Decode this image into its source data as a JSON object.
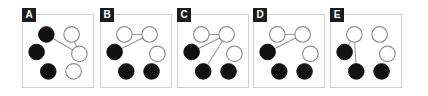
{
  "figure": {
    "panel_count": 5,
    "node_count_per_panel": 6,
    "colors": {
      "filled_node": "#111111",
      "open_node_fill": "#ffffff",
      "open_node_stroke": "#8f8f8f",
      "edge": "#9a9a9a",
      "panel_border": "#cfcfcf",
      "badge_background": "#1c1c1c",
      "badge_text": "#ffffff",
      "background": "#ffffff"
    },
    "node_layout": [
      {
        "id": "tl",
        "cx": 24,
        "cy": 20
      },
      {
        "id": "tr",
        "cx": 50,
        "cy": 20
      },
      {
        "id": "ml",
        "cx": 14,
        "cy": 38
      },
      {
        "id": "mr",
        "cx": 58,
        "cy": 40
      },
      {
        "id": "bl",
        "cx": 26,
        "cy": 58
      },
      {
        "id": "br",
        "cx": 52,
        "cy": 58
      }
    ],
    "node_radius": 8,
    "panels": [
      {
        "label": "A",
        "left": 22,
        "nodes": [
          {
            "id": "tl",
            "state": "filled"
          },
          {
            "id": "tr",
            "state": "open"
          },
          {
            "id": "ml",
            "state": "filled"
          },
          {
            "id": "mr",
            "state": "open"
          },
          {
            "id": "bl",
            "state": "filled"
          },
          {
            "id": "br",
            "state": "open"
          }
        ],
        "edges": [
          {
            "from": "tl",
            "to": "mr"
          },
          {
            "from": "tr",
            "to": "mr"
          }
        ]
      },
      {
        "label": "B",
        "left": 100,
        "nodes": [
          {
            "id": "tl",
            "state": "open"
          },
          {
            "id": "tr",
            "state": "open"
          },
          {
            "id": "ml",
            "state": "filled"
          },
          {
            "id": "mr",
            "state": "open"
          },
          {
            "id": "bl",
            "state": "filled"
          },
          {
            "id": "br",
            "state": "filled"
          }
        ],
        "edges": [
          {
            "from": "tl",
            "to": "tr"
          },
          {
            "from": "ml",
            "to": "tr"
          }
        ]
      },
      {
        "label": "C",
        "left": 177,
        "nodes": [
          {
            "id": "tl",
            "state": "open"
          },
          {
            "id": "tr",
            "state": "open"
          },
          {
            "id": "ml",
            "state": "filled"
          },
          {
            "id": "mr",
            "state": "open"
          },
          {
            "id": "bl",
            "state": "filled"
          },
          {
            "id": "br",
            "state": "filled"
          }
        ],
        "edges": [
          {
            "from": "tl",
            "to": "tr"
          },
          {
            "from": "ml",
            "to": "tr"
          },
          {
            "from": "bl",
            "to": "tr"
          }
        ]
      },
      {
        "label": "D",
        "left": 253,
        "nodes": [
          {
            "id": "tl",
            "state": "open"
          },
          {
            "id": "tr",
            "state": "open"
          },
          {
            "id": "ml",
            "state": "filled"
          },
          {
            "id": "mr",
            "state": "open"
          },
          {
            "id": "bl",
            "state": "filled"
          },
          {
            "id": "br",
            "state": "filled"
          }
        ],
        "edges": [
          {
            "from": "tl",
            "to": "tr"
          },
          {
            "from": "ml",
            "to": "tr"
          }
        ]
      },
      {
        "label": "E",
        "left": 330,
        "nodes": [
          {
            "id": "tl",
            "state": "open"
          },
          {
            "id": "tr",
            "state": "open"
          },
          {
            "id": "ml",
            "state": "filled"
          },
          {
            "id": "mr",
            "state": "open"
          },
          {
            "id": "bl",
            "state": "filled"
          },
          {
            "id": "br",
            "state": "filled"
          }
        ],
        "edges": [
          {
            "from": "tl",
            "to": "ml"
          },
          {
            "from": "tl",
            "to": "bl"
          }
        ]
      }
    ]
  }
}
